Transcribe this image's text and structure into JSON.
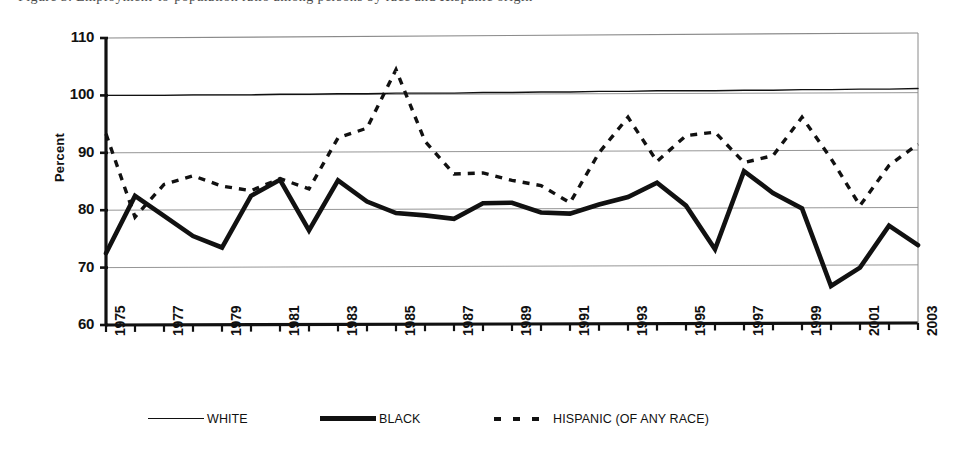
{
  "caption": {
    "text": "Figure 3. Employment-to-population ratio among persons by race and Hispanic origin"
  },
  "axis": {
    "ylabel": "Percent",
    "yticks": [
      "110",
      "100",
      "90",
      "80",
      "70",
      "60"
    ],
    "xticks": [
      "1975",
      "1977",
      "1979",
      "1981",
      "1983",
      "1985",
      "1987",
      "1989",
      "1991",
      "1993",
      "1995",
      "1997",
      "1999",
      "2001",
      "2003"
    ]
  },
  "legend": {
    "items": [
      {
        "label": "WHITE",
        "style": "thin-solid",
        "icon": "line-thin-icon"
      },
      {
        "label": "BLACK",
        "style": "thick-solid",
        "icon": "line-thick-icon"
      },
      {
        "label": "HISPANIC (OF ANY RACE)",
        "style": "dashed",
        "icon": "line-dashed-icon"
      }
    ]
  },
  "colors": {
    "ink": "#111111",
    "grid": "#8a8a8a",
    "background": "#ffffff"
  },
  "chart_data": {
    "type": "line",
    "title": "",
    "xlabel": "",
    "ylabel": "Percent",
    "xlim": [
      1975,
      2003
    ],
    "ylim": [
      60,
      110
    ],
    "ytick_step": 10,
    "grid": true,
    "legend_position": "bottom",
    "x": [
      1975,
      1976,
      1977,
      1978,
      1979,
      1980,
      1981,
      1982,
      1983,
      1984,
      1985,
      1986,
      1987,
      1988,
      1989,
      1990,
      1991,
      1992,
      1993,
      1994,
      1995,
      1996,
      1997,
      1998,
      1999,
      2000,
      2001,
      2002,
      2003
    ],
    "series": [
      {
        "name": "WHITE",
        "style": "thin-solid",
        "values": [
          100.0,
          100.0,
          100.0,
          100.1,
          100.1,
          100.1,
          100.2,
          100.2,
          100.3,
          100.3,
          100.4,
          100.4,
          100.4,
          100.5,
          100.5,
          100.6,
          100.6,
          100.7,
          100.7,
          100.8,
          100.8,
          100.8,
          100.9,
          100.9,
          101.0,
          101.0,
          101.1,
          101.1,
          101.2
        ]
      },
      {
        "name": "BLACK",
        "style": "thick-solid",
        "values": [
          72.5,
          82.5,
          79.0,
          75.5,
          73.5,
          82.5,
          85.3,
          76.5,
          85.2,
          81.5,
          79.5,
          79.1,
          78.5,
          81.2,
          81.3,
          79.6,
          79.4,
          81.0,
          82.3,
          84.8,
          80.8,
          73.2,
          86.8,
          83.0,
          80.3,
          66.8,
          70.0,
          77.3,
          73.9
        ]
      },
      {
        "name": "HISPANIC (OF ANY RACE)",
        "style": "dashed",
        "values": [
          93.3,
          78.8,
          84.5,
          86.0,
          84.2,
          83.4,
          85.5,
          83.7,
          92.6,
          94.3,
          104.5,
          92.0,
          86.3,
          86.5,
          85.2,
          84.3,
          81.3,
          90.0,
          96.2,
          88.5,
          93.0,
          93.6,
          88.3,
          89.5,
          96.2,
          89.0,
          80.8,
          87.8,
          91.5
        ]
      }
    ],
    "note": "BLACK extends 1975-2003; WHITE and HISPANIC sampled at same yearly ticks; HISPANIC peak 104.5 near 1982; BLACK minimum 66.8 near 1997."
  }
}
